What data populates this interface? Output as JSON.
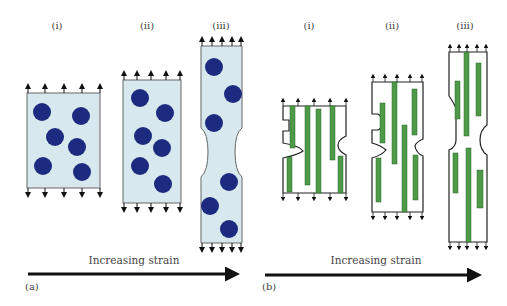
{
  "panels": {
    "a": {
      "label": "(a)",
      "arrow_caption": "Increasing strain",
      "stages": [
        {
          "label": "(i)"
        },
        {
          "label": "(ii)"
        },
        {
          "label": "(iii)"
        }
      ],
      "description": "Matrix with dispersed circular particles stretched under increasing strain, necking in stage iii"
    },
    "b": {
      "label": "(b)",
      "arrow_caption": "Increasing strain",
      "stages": [
        {
          "label": "(i)"
        },
        {
          "label": "(ii)"
        },
        {
          "label": "(iii)"
        }
      ],
      "description": "Matrix with aligned fibers stretched under increasing strain, necking in stages"
    }
  },
  "colors": {
    "matrix_fill": "#d7e8ef",
    "particle": "#1c2b80",
    "fiber": "#4e9a48",
    "outline": "#333333",
    "arrow": "#111111",
    "text": "#444444"
  }
}
